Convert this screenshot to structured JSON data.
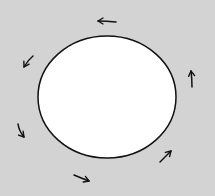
{
  "diagram": {
    "background_color": "#d3d3d3",
    "shape": {
      "type": "ellipse",
      "fill": "#ffffff",
      "stroke": "#111111",
      "cx": 107,
      "cy": 97,
      "rx": 69,
      "ry": 61
    },
    "rotation_direction": "counter-clockwise",
    "arrows": [
      {
        "id": "top",
        "direction": "left"
      },
      {
        "id": "upper-left",
        "direction": "down-left"
      },
      {
        "id": "lower-left",
        "direction": "down"
      },
      {
        "id": "bottom",
        "direction": "right"
      },
      {
        "id": "lower-right",
        "direction": "up-right"
      },
      {
        "id": "right",
        "direction": "up"
      }
    ]
  }
}
